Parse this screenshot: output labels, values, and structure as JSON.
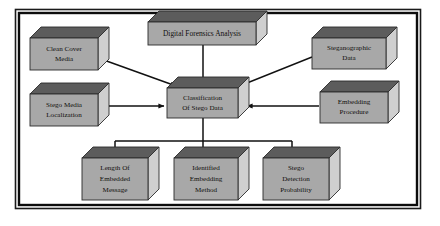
{
  "diagram": {
    "frame": {
      "outer_color": "#1a1a1a",
      "inner_color": "#0d0d0d",
      "background": "#ffffff"
    },
    "style": {
      "box_front_color": "#a8a8a8",
      "box_top_color": "#5c5c5c",
      "box_side_color": "#cfcfcf",
      "box_edge_color": "#2b2b2b",
      "arrow_color": "#111111",
      "text_color": "#100f0d"
    },
    "nodes": [
      {
        "id": "clean-cover-media",
        "name": "clean-cover-media-box",
        "lines": [
          "Clean Cover",
          "Media"
        ],
        "x": 30,
        "y": 38,
        "w": 68,
        "h": 32,
        "depth": 11
      },
      {
        "id": "digital-forensics-analysis",
        "name": "digital-forensics-analysis-box",
        "lines": [
          "Digital Forensics Analysis"
        ],
        "x": 148,
        "y": 22,
        "w": 108,
        "h": 23,
        "depth": 11
      },
      {
        "id": "steganographic-data",
        "name": "steganographic-data-box",
        "lines": [
          "Steganographic",
          "Data"
        ],
        "x": 312,
        "y": 38,
        "w": 74,
        "h": 31,
        "depth": 11
      },
      {
        "id": "stego-media-localization",
        "name": "stego-media-localization-box",
        "lines": [
          "Stego Media",
          "Localization"
        ],
        "x": 30,
        "y": 94,
        "w": 68,
        "h": 32,
        "depth": 11
      },
      {
        "id": "classification-of-stego-data",
        "name": "classification-of-stego-data-box",
        "lines": [
          "Classification",
          "Of Stego Data"
        ],
        "x": 167,
        "y": 88,
        "w": 71,
        "h": 30,
        "depth": 11
      },
      {
        "id": "embedding-procedure",
        "name": "embedding-procedure-box",
        "lines": [
          "Embedding",
          "Procedure"
        ],
        "x": 320,
        "y": 92,
        "w": 68,
        "h": 31,
        "depth": 11
      },
      {
        "id": "length-of-embedded-message",
        "name": "length-of-embedded-message-box",
        "lines": [
          "Length Of",
          "Embedded",
          "Message"
        ],
        "x": 82,
        "y": 158,
        "w": 66,
        "h": 42,
        "depth": 11
      },
      {
        "id": "identified-embedding-method",
        "name": "identified-embedding-method-box",
        "lines": [
          "Identified",
          "Embedding",
          "Method"
        ],
        "x": 174,
        "y": 158,
        "w": 64,
        "h": 42,
        "depth": 11
      },
      {
        "id": "stego-detection-probability",
        "name": "stego-detection-probability-box",
        "lines": [
          "Stego",
          "Detection",
          "Probability"
        ],
        "x": 263,
        "y": 158,
        "w": 66,
        "h": 42,
        "depth": 11
      }
    ],
    "edges": [
      {
        "id": "edge-clean-cover-to-classification",
        "name": "arrow-clean-cover-media-to-classification",
        "from": "clean-cover-media",
        "to": "classification-of-stego-data",
        "kind": "diagonal"
      },
      {
        "id": "edge-forensics-to-classification",
        "name": "arrow-digital-forensics-analysis-to-classification",
        "from": "digital-forensics-analysis",
        "to": "classification-of-stego-data",
        "kind": "vertical"
      },
      {
        "id": "edge-steganographic-to-classification",
        "name": "arrow-steganographic-data-to-classification",
        "from": "steganographic-data",
        "to": "classification-of-stego-data",
        "kind": "diagonal"
      },
      {
        "id": "edge-localization-to-classification",
        "name": "arrow-stego-media-localization-to-classification",
        "from": "stego-media-localization",
        "to": "classification-of-stego-data",
        "kind": "horizontal"
      },
      {
        "id": "edge-embedding-to-classification",
        "name": "arrow-embedding-procedure-to-classification",
        "from": "embedding-procedure",
        "to": "classification-of-stego-data",
        "kind": "horizontal"
      },
      {
        "id": "edge-classification-to-length",
        "name": "arrow-classification-to-length-of-embedded-message",
        "from": "classification-of-stego-data",
        "to": "length-of-embedded-message",
        "kind": "bus"
      },
      {
        "id": "edge-classification-to-identified",
        "name": "arrow-classification-to-identified-embedding-method",
        "from": "classification-of-stego-data",
        "to": "identified-embedding-method",
        "kind": "bus"
      },
      {
        "id": "edge-classification-to-detection",
        "name": "arrow-classification-to-stego-detection-probability",
        "from": "classification-of-stego-data",
        "to": "stego-detection-probability",
        "kind": "bus"
      }
    ]
  }
}
